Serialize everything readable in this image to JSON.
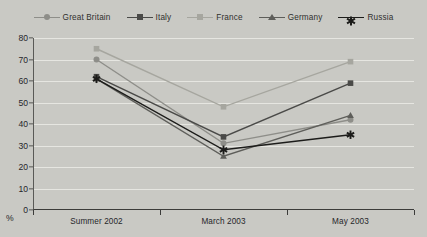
{
  "chart_data": {
    "type": "line",
    "title": "",
    "xlabel": "",
    "ylabel": "%",
    "categories": [
      "Summer 2002",
      "March 2003",
      "May 2003"
    ],
    "ylim": [
      0,
      80
    ],
    "yticks": [
      0,
      10,
      20,
      30,
      40,
      50,
      60,
      70,
      80
    ],
    "grid": true,
    "legend_position": "top",
    "series": [
      {
        "name": "Great Britain",
        "marker": "circle",
        "color": "#8e8e89",
        "values": [
          70,
          31,
          42
        ]
      },
      {
        "name": "Italy",
        "marker": "square",
        "color": "#4a4a48",
        "values": [
          62,
          34,
          59
        ]
      },
      {
        "name": "France",
        "marker": "square",
        "color": "#a6a69f",
        "values": [
          75,
          48,
          69
        ]
      },
      {
        "name": "Germany",
        "marker": "triangle",
        "color": "#5e5e5a",
        "values": [
          61,
          25,
          44
        ]
      },
      {
        "name": "Russia",
        "marker": "asterisk",
        "color": "#1c1c1a",
        "values": [
          61,
          28,
          35
        ]
      }
    ]
  },
  "axis": {
    "y_unit_label": "%",
    "y_tick_labels": [
      "0",
      "10",
      "20",
      "30",
      "40",
      "50",
      "60",
      "70",
      "80"
    ],
    "x_tick_labels": [
      "Summer 2002",
      "March 2003",
      "May 2003"
    ]
  },
  "legend": {
    "items": [
      {
        "label": "Great Britain"
      },
      {
        "label": "Italy"
      },
      {
        "label": "France"
      },
      {
        "label": "Germany"
      },
      {
        "label": "Russia"
      }
    ]
  },
  "colors": {
    "background": "#c9c9c4",
    "gridline": "#e6e6e1",
    "axis": "#3c3c3a",
    "text": "#26262a"
  }
}
